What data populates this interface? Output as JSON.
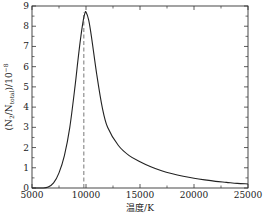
{
  "chart_data": {
    "type": "line",
    "title": "",
    "xlabel": "温度/K",
    "ylabel": "(N₂/N_total)/10⁻⁸",
    "xlim": [
      5000,
      25000
    ],
    "ylim": [
      0,
      9
    ],
    "grid": false,
    "legend": null,
    "xticks": [
      5000,
      10000,
      15000,
      20000,
      25000
    ],
    "xtick_labels": [
      "5000",
      "10000",
      "15000",
      "20000",
      "25000"
    ],
    "yticks": [
      0,
      1,
      2,
      3,
      4,
      5,
      6,
      7,
      8,
      9
    ],
    "ytick_labels": [
      "0",
      "1",
      "2",
      "3",
      "4",
      "5",
      "6",
      "7",
      "8",
      "9"
    ],
    "series": [
      {
        "name": "N2/Ntotal",
        "style": "solid",
        "x": [
          5000,
          6000,
          6500,
          7000,
          7500,
          8000,
          8500,
          9000,
          9250,
          9500,
          9750,
          9900,
          10000,
          10250,
          10500,
          11000,
          11500,
          12000,
          13000,
          14000,
          15000,
          16000,
          17000,
          18000,
          19000,
          20000,
          21000,
          22000,
          23000,
          24000,
          25000
        ],
        "values": [
          0,
          0.0,
          0.05,
          0.25,
          0.75,
          1.6,
          3.0,
          5.1,
          6.3,
          7.4,
          8.3,
          8.65,
          8.7,
          8.3,
          7.5,
          5.6,
          4.0,
          3.0,
          2.1,
          1.6,
          1.3,
          1.05,
          0.85,
          0.7,
          0.58,
          0.48,
          0.4,
          0.33,
          0.28,
          0.23,
          0.2
        ]
      }
    ],
    "annotations": [
      {
        "type": "vline",
        "x": 9800,
        "style": "dashed",
        "ymax": 8.7,
        "description": "peak position"
      }
    ]
  }
}
